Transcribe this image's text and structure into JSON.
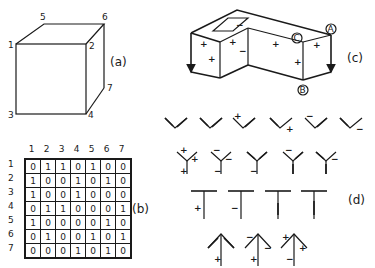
{
  "panels": {
    "a": {
      "caption": "(a)",
      "vertex_labels": [
        "1",
        "2",
        "3",
        "4",
        "5",
        "6",
        "7"
      ]
    },
    "b": {
      "caption": "(b)",
      "column_headers": [
        "1",
        "2",
        "3",
        "4",
        "5",
        "6",
        "7"
      ],
      "row_headers": [
        "1",
        "2",
        "3",
        "4",
        "5",
        "6",
        "7"
      ],
      "matrix": [
        [
          "0",
          "1",
          "1",
          "0",
          "1",
          "0",
          "0"
        ],
        [
          "1",
          "0",
          "0",
          "1",
          "0",
          "1",
          "0"
        ],
        [
          "1",
          "0",
          "0",
          "1",
          "0",
          "0",
          "0"
        ],
        [
          "0",
          "1",
          "1",
          "0",
          "0",
          "0",
          "1"
        ],
        [
          "1",
          "0",
          "0",
          "0",
          "0",
          "1",
          "0"
        ],
        [
          "0",
          "1",
          "0",
          "0",
          "1",
          "0",
          "1"
        ],
        [
          "0",
          "0",
          "0",
          "1",
          "0",
          "1",
          "0"
        ]
      ]
    },
    "c": {
      "caption": "(c)",
      "vertex_labels": {
        "A": "A",
        "B": "B",
        "C": "C"
      },
      "signs": {
        "plus": "+",
        "minus": "−"
      }
    },
    "d": {
      "caption": "(d)",
      "plus": "+",
      "minus": "−"
    }
  }
}
